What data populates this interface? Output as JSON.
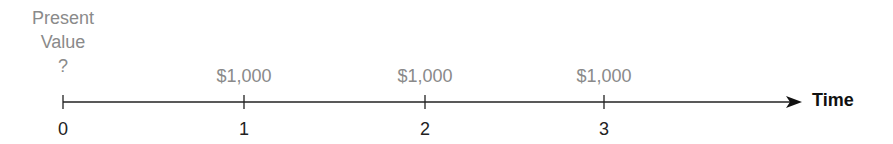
{
  "present_value": {
    "line1": "Present",
    "line2": "Value",
    "line3": "?"
  },
  "axis": {
    "label": "Time",
    "color": "#222222"
  },
  "periods": [
    {
      "label": "0",
      "x": 63,
      "amount": ""
    },
    {
      "label": "1",
      "x": 244,
      "amount": "$1,000"
    },
    {
      "label": "2",
      "x": 425,
      "amount": "$1,000"
    },
    {
      "label": "3",
      "x": 604,
      "amount": "$1,000"
    }
  ]
}
